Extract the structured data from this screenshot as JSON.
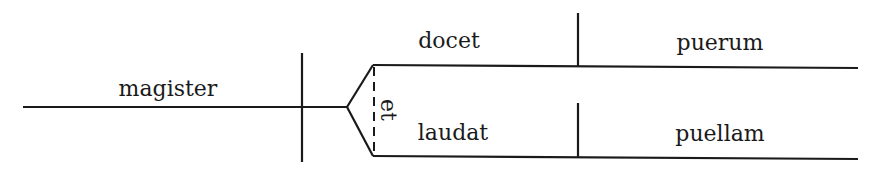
{
  "diagram": {
    "type": "Reed-Kellogg sentence diagram",
    "subject": "magister",
    "conjunction": "et",
    "predicates": [
      {
        "verb": "docet",
        "object": "puerum"
      },
      {
        "verb": "laudat",
        "object": "puellam"
      }
    ],
    "colors": {
      "ink": "#1a1a1a",
      "background": "#ffffff"
    }
  }
}
